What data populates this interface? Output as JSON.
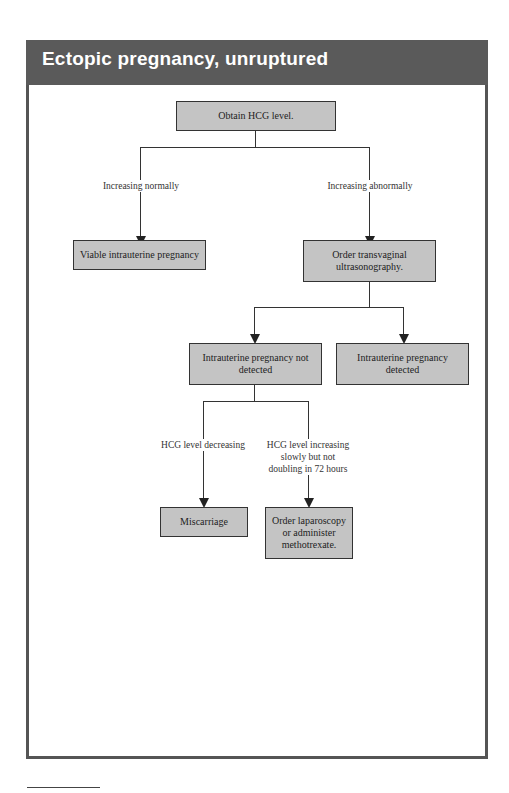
{
  "header": {
    "title": "Ectopic pregnancy, unruptured"
  },
  "nodes": {
    "start": "Obtain HCG level.",
    "viable": "Viable intrauterine pregnancy",
    "ultrasound": "Order transvaginal ultrasonography.",
    "not_detected": "Intrauterine pregnancy not detected",
    "detected": "Intrauterine pregnancy detected",
    "miscarriage": "Miscarriage",
    "laparoscopy": "Order laparoscopy or administer methotrexate."
  },
  "edges": {
    "increasing_normally": "Increasing normally",
    "increasing_abnormally": "Increasing abnormally",
    "hcg_decreasing": "HCG level decreasing",
    "hcg_increasing_slowly": "HCG level increasing slowly but not doubling in 72 hours"
  },
  "colors": {
    "title_bar": "#5a5a5a",
    "box_fill": "#c4c4c4",
    "frame_border": "#555555"
  }
}
